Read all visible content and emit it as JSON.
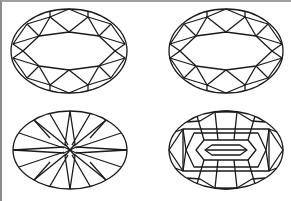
{
  "diagram": {
    "type": "gemstone-cut-illustrations",
    "layout": "2x2 grid",
    "stroke_color": "#1a1a1a",
    "background": "#ffffff",
    "border_color": "#8c8c8c",
    "items": [
      {
        "position": "top-left",
        "shape": "oval",
        "style": "brilliant cut with large oval table",
        "cx": 69,
        "cy": 51,
        "rx": 58,
        "ry": 42
      },
      {
        "position": "top-right",
        "shape": "oval",
        "style": "brilliant cut with large oval table",
        "cx": 226,
        "cy": 51,
        "rx": 57,
        "ry": 42
      },
      {
        "position": "bottom-left",
        "shape": "oval",
        "style": "radiating star pavilion (culet view)",
        "cx": 70,
        "cy": 150,
        "rx": 57,
        "ry": 39
      },
      {
        "position": "bottom-right",
        "shape": "oval",
        "style": "step/modified pavilion with central keel",
        "cx": 226,
        "cy": 150,
        "rx": 57,
        "ry": 39
      }
    ]
  }
}
